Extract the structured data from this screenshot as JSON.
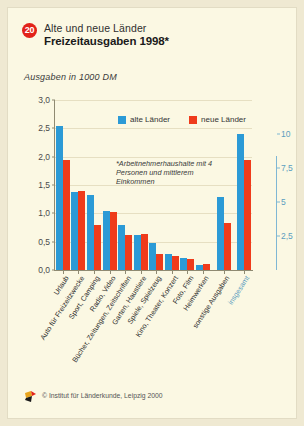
{
  "header": {
    "number": "20",
    "line1": "Alte und neue Länder",
    "line2": "Freizeitausgaben 1998*"
  },
  "subtitle": "Ausgaben in 1000 DM",
  "legend": [
    {
      "label": "alte Länder",
      "color": "#2b9ad6"
    },
    {
      "label": "neue Länder",
      "color": "#ef3b1b"
    }
  ],
  "annotation": "*Arbeitnehmerhaushalte mit 4 Personen und mittlerem Einkommen",
  "footer": {
    "credit": "© Institut für Länderkunde, Leipzig 2000"
  },
  "chart_data": {
    "type": "bar",
    "title": "Freizeitausgaben 1998*",
    "subtitle": "Alte und neue Länder",
    "ylabel": "Ausgaben in 1000 DM",
    "xlabel": "",
    "ylim": [
      0,
      3.0
    ],
    "yticks": [
      "0,0",
      "0,5",
      "1,0",
      "1,5",
      "2,0",
      "2,5",
      "3,0"
    ],
    "ytick_values": [
      0,
      0.5,
      1.0,
      1.5,
      2.0,
      2.5,
      3.0
    ],
    "y2lim": [
      0,
      12.5
    ],
    "y2ticks": [
      "2,5",
      "5",
      "7,5",
      "10"
    ],
    "y2tick_values": [
      2.5,
      5,
      7.5,
      10
    ],
    "grid": true,
    "legend_position": "top-center",
    "categories": [
      "Urlaub",
      "Auto für Freizeitzwecke",
      "Sport, Camping",
      "Radio, Video",
      "Bücher, Zeitungen, Zeitschriften",
      "Garten, Haustiere",
      "Spiele, Spielzeug",
      "Kino, Theater, Konzert",
      "Foto, Film",
      "Heimwerken",
      "sonstige Ausgaben",
      "insgesamt"
    ],
    "series": [
      {
        "name": "alte Länder",
        "color": "#2b9ad6",
        "values": [
          2.55,
          1.38,
          1.33,
          1.05,
          0.8,
          0.61,
          0.48,
          0.29,
          0.22,
          0.09,
          1.28,
          10.0
        ]
      },
      {
        "name": "neue Länder",
        "color": "#ef3b1b",
        "values": [
          1.95,
          1.4,
          0.79,
          1.02,
          0.62,
          0.64,
          0.28,
          0.24,
          0.19,
          0.1,
          0.83,
          8.1
        ]
      }
    ],
    "secondary_axis_categories": [
      "insgesamt"
    ],
    "note": "Letzte Gruppe 'insgesamt' bezieht sich auf die rechte Achse"
  }
}
